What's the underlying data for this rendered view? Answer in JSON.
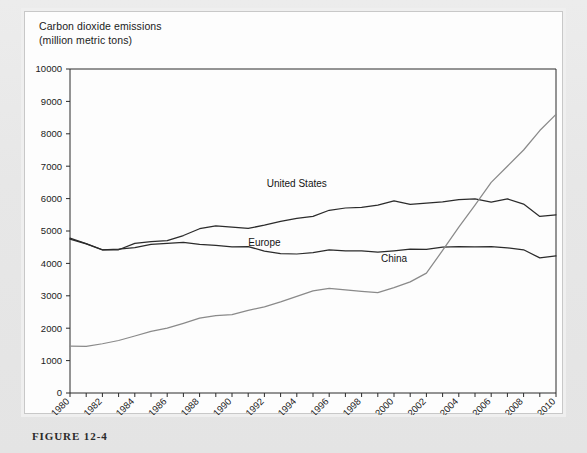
{
  "figure": {
    "caption": "FIGURE 12-4"
  },
  "chart_data": {
    "type": "line",
    "title": "Carbon dioxide emissions\n(million metric tons)",
    "title_line1": "Carbon dioxide emissions",
    "title_line2": "(million metric tons)",
    "xlabel": "",
    "ylabel": "",
    "ylim": [
      0,
      10000
    ],
    "xlim": [
      1980,
      2010
    ],
    "ytick_step": 1000,
    "yticks": [
      0,
      1000,
      2000,
      3000,
      4000,
      5000,
      6000,
      7000,
      8000,
      9000,
      10000
    ],
    "ytick_labels": [
      "0",
      "1000",
      "2000",
      "3000",
      "4000",
      "5000",
      "6000",
      "7000",
      "8000",
      "9000",
      "10000"
    ],
    "xticks": [
      1980,
      1981,
      1982,
      1983,
      1984,
      1985,
      1986,
      1987,
      1988,
      1989,
      1990,
      1991,
      1992,
      1993,
      1994,
      1995,
      1996,
      1997,
      1998,
      1999,
      2000,
      2001,
      2002,
      2003,
      2004,
      2005,
      2006,
      2007,
      2008,
      2009,
      2010
    ],
    "xtick_labels": [
      "1980",
      "1982",
      "1984",
      "1986",
      "1988",
      "1990",
      "1992",
      "1994",
      "1996",
      "1998",
      "2000",
      "2002",
      "2004",
      "2006",
      "2008",
      "2010"
    ],
    "xtick_labeled_values": [
      1980,
      1982,
      1984,
      1986,
      1988,
      1990,
      1992,
      1994,
      1996,
      1998,
      2000,
      2002,
      2004,
      2006,
      2008,
      2010
    ],
    "grid": false,
    "legend_position": "inline-annotations",
    "x": [
      1980,
      1981,
      1982,
      1983,
      1984,
      1985,
      1986,
      1987,
      1988,
      1989,
      1990,
      1991,
      1992,
      1993,
      1994,
      1995,
      1996,
      1997,
      1998,
      1999,
      2000,
      2001,
      2002,
      2003,
      2004,
      2005,
      2006,
      2007,
      2008,
      2009,
      2010
    ],
    "series": [
      {
        "name": "United States",
        "color": "#2b2b2b",
        "label_x": 1994,
        "label_y": 6350,
        "values": [
          4750,
          4600,
          4420,
          4420,
          4620,
          4670,
          4700,
          4860,
          5070,
          5160,
          5120,
          5080,
          5180,
          5300,
          5390,
          5450,
          5640,
          5710,
          5730,
          5800,
          5930,
          5820,
          5860,
          5900,
          5970,
          5990,
          5890,
          5990,
          5830,
          5450,
          5500
        ]
      },
      {
        "name": "Europe",
        "color": "#2b2b2b",
        "label_x": 1992,
        "label_y": 4550,
        "values": [
          4780,
          4610,
          4420,
          4440,
          4490,
          4590,
          4620,
          4650,
          4590,
          4560,
          4510,
          4520,
          4380,
          4300,
          4290,
          4330,
          4420,
          4390,
          4390,
          4350,
          4390,
          4440,
          4430,
          4500,
          4520,
          4510,
          4520,
          4480,
          4420,
          4170,
          4230
        ]
      },
      {
        "name": "China",
        "color": "#8a8a8a",
        "label_x": 2000,
        "label_y": 4050,
        "values": [
          1450,
          1440,
          1520,
          1620,
          1760,
          1900,
          2000,
          2150,
          2310,
          2390,
          2420,
          2550,
          2660,
          2810,
          2980,
          3150,
          3230,
          3180,
          3140,
          3100,
          3250,
          3430,
          3700,
          4400,
          5120,
          5800,
          6500,
          7000,
          7500,
          8100,
          8600
        ]
      }
    ]
  }
}
